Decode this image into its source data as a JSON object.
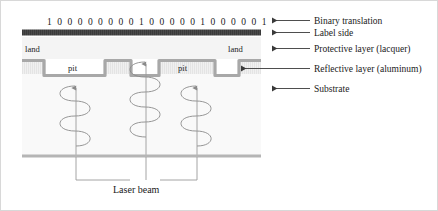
{
  "figure": {
    "binary": {
      "value": "1 0 0 0 0 0 0 0 0 1 0 0 0 0 0 1 0 0 0 0 0 1",
      "raw": "1000000001000001000001"
    },
    "surface_labels": {
      "land_left": "land",
      "land_right": "land",
      "pit_left": "pit",
      "pit_right": "pit"
    },
    "callouts": [
      {
        "name": "binary-translation",
        "label": "Binary translation"
      },
      {
        "name": "label-side",
        "label": "Label side"
      },
      {
        "name": "protective-layer",
        "label": "Protective layer (lacquer)"
      },
      {
        "name": "reflective-layer",
        "label": "Reflective layer (aluminum)"
      },
      {
        "name": "substrate",
        "label": "Substrate"
      }
    ],
    "laser_beam_label": "Laser beam",
    "colors": {
      "label_side_bar": "#4a4a4a",
      "reflective_layer": "#a8a8a8",
      "substrate_line": "#b5b5b5",
      "protective_layer_fill": "#f2f2f2",
      "substrate_fill": "#f7f7f7",
      "leader_line": "#4a4a4a",
      "helix": "#8a8a8a",
      "text": "#1a1a1a",
      "border": "#d8d8d8"
    }
  }
}
